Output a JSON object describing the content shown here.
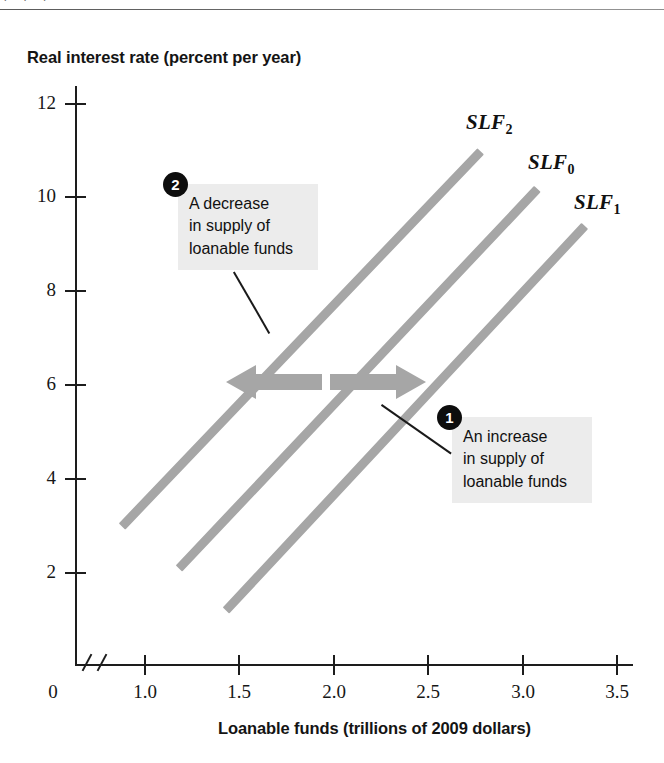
{
  "page": {
    "top_fragments": "' ' '"
  },
  "chart_data": {
    "type": "line",
    "title": "",
    "xlabel": "Loanable funds (trillions of 2009 dollars)",
    "ylabel": "Real interest rate (percent per year)",
    "xlim": [
      0.78,
      3.62
    ],
    "ylim": [
      0,
      12.6
    ],
    "axis_break": true,
    "grid": false,
    "legend_position": "inline-labels",
    "x_ticks": [
      "1.0",
      "1.5",
      "2.0",
      "2.5",
      "3.0",
      "3.5"
    ],
    "x_tick_values": [
      1.0,
      1.5,
      2.0,
      2.5,
      3.0,
      3.5
    ],
    "y_ticks": [
      "12",
      "10",
      "8",
      "6",
      "4",
      "2"
    ],
    "y_tick_values": [
      12,
      10,
      8,
      6,
      4,
      2
    ],
    "origin_label": "0",
    "series": [
      {
        "name": "SLF2",
        "label": "SLF",
        "subscript": "2",
        "color": "#a6a6a6",
        "points": [
          [
            0.88,
            3.0
          ],
          [
            2.78,
            11.0
          ]
        ]
      },
      {
        "name": "SLF0",
        "label": "SLF",
        "subscript": "0",
        "color": "#a6a6a6",
        "points": [
          [
            1.18,
            2.1
          ],
          [
            3.08,
            10.2
          ]
        ]
      },
      {
        "name": "SLF1",
        "label": "SLF",
        "subscript": "1",
        "color": "#a6a6a6",
        "points": [
          [
            1.43,
            1.2
          ],
          [
            3.33,
            9.4
          ]
        ]
      }
    ],
    "annotations": [
      {
        "id": "2",
        "badge": "2",
        "text": "A decrease\nin supply of\nloanable funds",
        "points_to": "SLF2 shift (leftward arrow)"
      },
      {
        "id": "1",
        "badge": "1",
        "text": "An increase\nin supply of\nloanable funds",
        "points_to": "SLF1 shift (rightward arrow)"
      }
    ],
    "arrows": [
      {
        "name": "decrease-arrow",
        "direction": "left",
        "color": "#a6a6a6"
      },
      {
        "name": "increase-arrow",
        "direction": "right",
        "color": "#a6a6a6"
      }
    ]
  }
}
